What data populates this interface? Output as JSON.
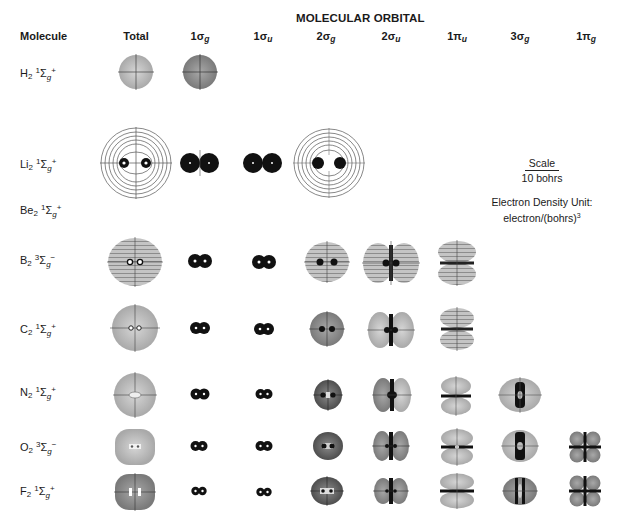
{
  "header": {
    "molecule_label": "Molecule",
    "group_title": "MOLECULAR ORBITAL"
  },
  "columns": [
    {
      "key": "total",
      "base": "Total",
      "sub": ""
    },
    {
      "key": "1sg",
      "base": "1σ",
      "sub": "g"
    },
    {
      "key": "1su",
      "base": "1σ",
      "sub": "u"
    },
    {
      "key": "2sg",
      "base": "2σ",
      "sub": "g"
    },
    {
      "key": "2su",
      "base": "2σ",
      "sub": "u"
    },
    {
      "key": "1pu",
      "base": "1π",
      "sub": "u"
    },
    {
      "key": "3sg",
      "base": "3σ",
      "sub": "g"
    },
    {
      "key": "1pg",
      "base": "1π",
      "sub": "g"
    }
  ],
  "molecules": [
    {
      "name": "H",
      "sub": "2",
      "mult": "1",
      "term": "Σ",
      "parity": "g",
      "sign": "+",
      "orbitals": [
        "total",
        "1sg"
      ]
    },
    {
      "name": "Li",
      "sub": "2",
      "mult": "1",
      "term": "Σ",
      "parity": "g",
      "sign": "+",
      "orbitals": [
        "total",
        "1sg",
        "1su",
        "2sg"
      ]
    },
    {
      "name": "Be",
      "sub": "2",
      "mult": "1",
      "term": "Σ",
      "parity": "g",
      "sign": "+",
      "orbitals": []
    },
    {
      "name": "B",
      "sub": "2",
      "mult": "3",
      "term": "Σ",
      "parity": "g",
      "sign": "−",
      "orbitals": [
        "total",
        "1sg",
        "1su",
        "2sg",
        "2su",
        "1pu"
      ]
    },
    {
      "name": "C",
      "sub": "2",
      "mult": "1",
      "term": "Σ",
      "parity": "g",
      "sign": "+",
      "orbitals": [
        "total",
        "1sg",
        "1su",
        "2sg",
        "2su",
        "1pu"
      ]
    },
    {
      "name": "N",
      "sub": "2",
      "mult": "1",
      "term": "Σ",
      "parity": "g",
      "sign": "+",
      "orbitals": [
        "total",
        "1sg",
        "1su",
        "2sg",
        "2su",
        "1pu",
        "3sg"
      ]
    },
    {
      "name": "O",
      "sub": "2",
      "mult": "3",
      "term": "Σ",
      "parity": "g",
      "sign": "−",
      "orbitals": [
        "total",
        "1sg",
        "1su",
        "2sg",
        "2su",
        "1pu",
        "3sg",
        "1pg"
      ]
    },
    {
      "name": "F",
      "sub": "2",
      "mult": "1",
      "term": "Σ",
      "parity": "g",
      "sign": "+",
      "orbitals": [
        "total",
        "1sg",
        "1su",
        "2sg",
        "2su",
        "1pu",
        "3sg",
        "1pg"
      ]
    }
  ],
  "legend": {
    "scale_label": "Scale",
    "scale_value": "10 bohrs",
    "density_line1": "Electron Density Unit:",
    "density_line2": "electron/(bohrs)",
    "density_exp": "3"
  },
  "colors": {
    "ink": "#1a1a1a",
    "shade_light": "#bdbdbd",
    "shade_mid": "#8f8f8f",
    "shade_dark": "#5a5a5a",
    "contour": "#555555",
    "background": "#ffffff"
  }
}
